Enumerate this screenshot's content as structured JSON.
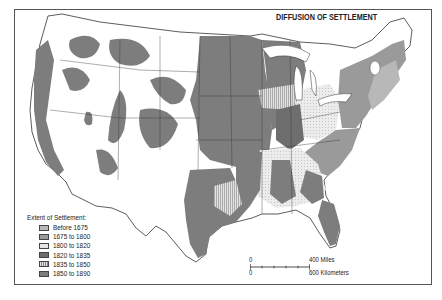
{
  "map": {
    "title": "DIFFUSION OF SETTLEMENT",
    "region": "Contiguous United States",
    "legend": {
      "title": "Extent of Settlement:",
      "items": [
        {
          "label": "Before 1675",
          "color": "#b8b8b8",
          "pattern": "light-gray"
        },
        {
          "label": "1675 to 1800",
          "color": "#9a9a9a",
          "pattern": "medium-gray"
        },
        {
          "label": "1800 to 1820",
          "color": "#e6e6e6",
          "pattern": "dotted-light"
        },
        {
          "label": "1820 to 1835",
          "color": "#6e6e6e",
          "pattern": "dark-gray"
        },
        {
          "label": "1835 to 1850",
          "color": "#d8d8d8",
          "pattern": "vertical-stripes"
        },
        {
          "label": "1850 to 1890",
          "color": "#7d7d7d",
          "pattern": "gray"
        }
      ]
    },
    "scale": {
      "miles_zero": "0",
      "miles_label": "400 Miles",
      "km_zero": "0",
      "km_label": "600 Kilometers"
    }
  }
}
